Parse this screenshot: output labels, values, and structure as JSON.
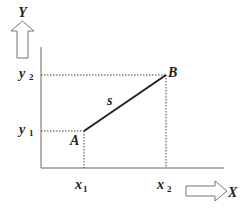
{
  "diagram": {
    "axes": {
      "y_label": "Y",
      "x_label": "X"
    },
    "points": {
      "A": {
        "label": "A"
      },
      "B": {
        "label": "B"
      }
    },
    "segment": {
      "label": "s"
    },
    "ticks": {
      "x1": {
        "base": "x",
        "sub": "1"
      },
      "x2": {
        "base": "x",
        "sub": "2"
      },
      "y1": {
        "base": "y",
        "sub": "1"
      },
      "y2": {
        "base": "y",
        "sub": "2"
      }
    },
    "colors": {
      "axis": "#999999",
      "segment": "#222222",
      "guide": "#444444",
      "arrow": "#777777",
      "text": "#222222"
    }
  }
}
